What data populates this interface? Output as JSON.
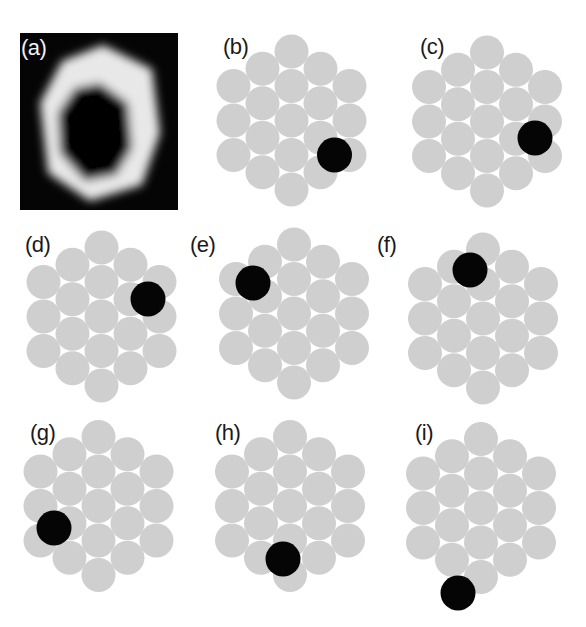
{
  "figure": {
    "panels": [
      {
        "id": "a",
        "label": "(a)",
        "type": "micrograph",
        "description": "hexagonal bright ring with dark core"
      },
      {
        "id": "b",
        "label": "(b)",
        "type": "cluster",
        "center": [
          291.5,
          120.5
        ],
        "label_pos": [
          223,
          36
        ],
        "highlight_offset": [
          43,
          34.5
        ]
      },
      {
        "id": "c",
        "label": "(c)",
        "type": "cluster",
        "center": [
          487,
          121.5
        ],
        "label_pos": [
          420,
          36
        ],
        "highlight_offset": [
          48,
          16.5
        ]
      },
      {
        "id": "d",
        "label": "(d)",
        "type": "cluster",
        "center": [
          101.5,
          316.5
        ],
        "label_pos": [
          25,
          234
        ],
        "highlight_offset": [
          46.5,
          -17.5
        ]
      },
      {
        "id": "e",
        "label": "(e)",
        "type": "cluster",
        "center": [
          294,
          313.5
        ],
        "label_pos": [
          190,
          234
        ],
        "highlight_offset": [
          -41,
          -30.5
        ]
      },
      {
        "id": "f",
        "label": "(f)",
        "type": "cluster",
        "center": [
          483,
          318.5
        ],
        "label_pos": [
          377,
          234
        ],
        "highlight_offset": [
          -13,
          -48.5
        ]
      },
      {
        "id": "g",
        "label": "(g)",
        "type": "cluster",
        "center": [
          98.5,
          506
        ],
        "label_pos": [
          30,
          422
        ],
        "highlight_offset": [
          -44.5,
          22
        ]
      },
      {
        "id": "h",
        "label": "(h)",
        "type": "cluster",
        "center": [
          290,
          506
        ],
        "label_pos": [
          215,
          422
        ],
        "highlight_offset": [
          -7,
          53
        ]
      },
      {
        "id": "i",
        "label": "(i)",
        "type": "cluster",
        "center": [
          481,
          508
        ],
        "label_pos": [
          415,
          422
        ],
        "highlight_offset": [
          -23,
          85
        ]
      }
    ],
    "cluster": {
      "circle_count": 19,
      "arrangement": "hexagonal close-packed, columns of 3-4-5-4-3",
      "radius": 17,
      "column_spacing": 29,
      "row_spacing": 34.5
    },
    "colors": {
      "cluster_fill": "#cfcfcf",
      "highlight_fill": "#050505",
      "photo_background": "#050505",
      "ring_light": "#e6e6e6"
    }
  }
}
